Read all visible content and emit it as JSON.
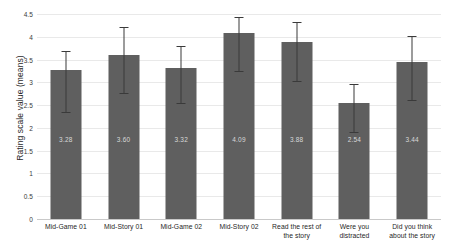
{
  "chart_data": {
    "type": "bar",
    "title": "",
    "xlabel": "",
    "ylabel": "Rating scale value (means)",
    "ylim": [
      0,
      4.5
    ],
    "grid": true,
    "legend": "none",
    "categories": [
      "Mid-Game 01",
      "Mid-Story 01",
      "Mid-Game 02",
      "Mid-Story 02",
      "Read the rest of the story",
      "Were you distracted",
      "Did you think about the story"
    ],
    "values": [
      3.28,
      3.6,
      3.32,
      4.09,
      3.88,
      2.54,
      3.44
    ],
    "value_labels": [
      "3.28",
      "3.60",
      "3.32",
      "4.09",
      "3.88",
      "2.54",
      "3.44"
    ],
    "error_low": [
      2.35,
      2.76,
      2.54,
      3.25,
      3.03,
      1.92,
      2.62
    ],
    "error_high": [
      3.68,
      4.22,
      3.8,
      4.44,
      4.32,
      2.96,
      4.02
    ],
    "yticks": [
      "0",
      "0.5",
      "1",
      "1.5",
      "2",
      "2.5",
      "3",
      "3.5",
      "4",
      "4.5"
    ],
    "ytick_values": [
      0,
      0.5,
      1,
      1.5,
      2,
      2.5,
      3,
      3.5,
      4,
      4.5
    ],
    "bar_color": "#5f5f5f",
    "grid_color": "#e9e9e9",
    "error_color": "#3a3a3a",
    "value_label_color": "#d8d8d8"
  }
}
